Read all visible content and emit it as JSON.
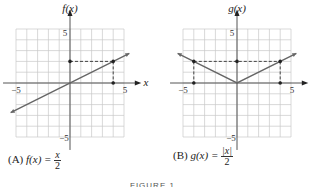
{
  "figure_caption": "FIGURE 1",
  "captions": {
    "a": {
      "label": "(A)",
      "lhs": "f(x) =",
      "num": "x",
      "den": "2"
    },
    "b": {
      "label": "(B)",
      "lhs": "g(x) =",
      "num": "|x|",
      "den": "2"
    }
  },
  "colors": {
    "grid": "#c8c8c8",
    "axis": "#555555",
    "curve": "#666666",
    "dash": "#333333"
  },
  "chart_data": [
    {
      "type": "line",
      "title": "(A) f(x) = x/2",
      "ylabel": "f(x)",
      "xlabel": "x",
      "xlim": [
        -5.5,
        5.5
      ],
      "ylim": [
        -5.5,
        5.5
      ],
      "xticks_labeled": [
        -5,
        5
      ],
      "yticks_labeled": [
        5,
        -5
      ],
      "grid": true,
      "series": [
        {
          "name": "f(x) = x/2",
          "x": [
            -5.5,
            5.5
          ],
          "y": [
            -2.75,
            2.75
          ]
        }
      ],
      "highlight_point": {
        "x": 4,
        "y": 2
      },
      "dashed_guides": [
        [
          [
            0,
            2
          ],
          [
            4,
            2
          ]
        ],
        [
          [
            4,
            2
          ],
          [
            4,
            0
          ]
        ]
      ],
      "marked_points": [
        [
          0,
          2
        ],
        [
          4,
          2
        ],
        [
          4,
          0
        ]
      ]
    },
    {
      "type": "line",
      "title": "(B) g(x) = |x|/2",
      "ylabel": "g(x)",
      "xlabel": "x",
      "xlim": [
        -5.5,
        5.5
      ],
      "ylim": [
        -5.5,
        5.5
      ],
      "xticks_labeled": [
        -5,
        5
      ],
      "yticks_labeled": [
        5,
        -5
      ],
      "grid": true,
      "series": [
        {
          "name": "g(x) = |x|/2",
          "x": [
            -5.5,
            0,
            5.5
          ],
          "y": [
            2.75,
            0,
            2.75
          ]
        }
      ],
      "highlight_points": [
        {
          "x": -4,
          "y": 2
        },
        {
          "x": 4,
          "y": 2
        }
      ],
      "dashed_guides": [
        [
          [
            -4,
            2
          ],
          [
            4,
            2
          ]
        ],
        [
          [
            -4,
            2
          ],
          [
            -4,
            0
          ]
        ],
        [
          [
            4,
            2
          ],
          [
            4,
            0
          ]
        ]
      ],
      "marked_points": [
        [
          -4,
          2
        ],
        [
          0,
          2
        ],
        [
          4,
          2
        ],
        [
          -4,
          0
        ],
        [
          4,
          0
        ]
      ]
    }
  ],
  "layout": {
    "panels": [
      {
        "ox": 70,
        "oy": 83,
        "unit": 10.8
      },
      {
        "ox": 237,
        "oy": 83,
        "unit": 10.8
      }
    ]
  }
}
